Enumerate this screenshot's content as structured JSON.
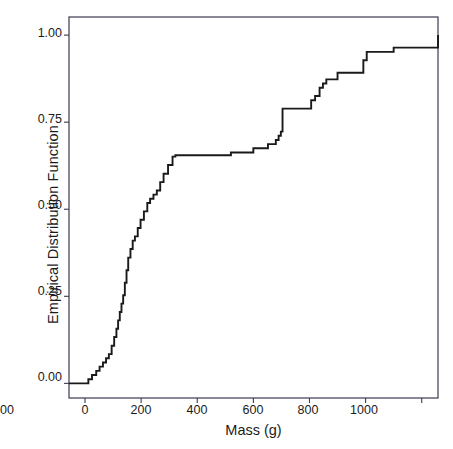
{
  "chart_data": {
    "type": "line",
    "subtype": "ecdf-step",
    "title": "",
    "xlabel": "Mass (g)",
    "ylabel": "Empirical Distribution Function",
    "xlim": [
      -57,
      1258
    ],
    "ylim": [
      -0.042,
      1.052
    ],
    "grid": false,
    "legend": null,
    "line_color": "#1a1a1a",
    "frame_color": "#3a3a50",
    "background": "#ffffff",
    "xticks": [
      0,
      200,
      400,
      600,
      800,
      1000,
      1200
    ],
    "xticklabels": [
      "0",
      "200",
      "400",
      "600",
      "800",
      "1000",
      "1200"
    ],
    "yticks": [
      0.0,
      0.25,
      0.5,
      0.75,
      1.0
    ],
    "yticklabels": [
      "0.00",
      "0.25",
      "0.50",
      "0.75",
      "1.00"
    ],
    "x": [
      -57,
      0,
      12,
      25,
      40,
      52,
      64,
      75,
      85,
      95,
      104,
      112,
      118,
      124,
      130,
      136,
      142,
      148,
      154,
      162,
      170,
      178,
      188,
      198,
      210,
      222,
      232,
      244,
      256,
      268,
      280,
      296,
      312,
      322,
      498,
      520,
      560,
      600,
      638,
      652,
      668,
      680,
      690,
      698,
      704,
      792,
      806,
      820,
      836,
      848,
      860,
      900,
      980,
      992,
      1004,
      1100,
      1258
    ],
    "y": [
      0.0,
      0.0,
      0.012,
      0.024,
      0.036,
      0.048,
      0.06,
      0.072,
      0.084,
      0.108,
      0.133,
      0.157,
      0.181,
      0.205,
      0.229,
      0.253,
      0.289,
      0.325,
      0.361,
      0.386,
      0.41,
      0.422,
      0.446,
      0.47,
      0.494,
      0.518,
      0.53,
      0.542,
      0.554,
      0.578,
      0.602,
      0.627,
      0.651,
      0.655,
      0.655,
      0.663,
      0.663,
      0.675,
      0.675,
      0.687,
      0.687,
      0.699,
      0.711,
      0.723,
      0.789,
      0.789,
      0.813,
      0.825,
      0.849,
      0.861,
      0.873,
      0.892,
      0.892,
      0.928,
      0.952,
      0.964,
      1.0
    ],
    "n_steps": 56
  },
  "axes": {
    "x_label": "Mass (g)",
    "y_label": "Empirical Distribution Function",
    "x_tick_labels": [
      "0",
      "200",
      "400",
      "600",
      "800",
      "1000",
      "1200"
    ],
    "y_tick_labels": [
      "0.00",
      "0.25",
      "0.50",
      "0.75",
      "1.00"
    ]
  }
}
